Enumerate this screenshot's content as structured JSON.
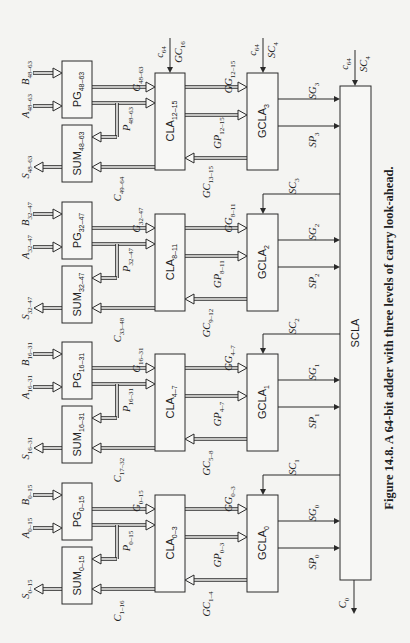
{
  "figure": {
    "caption": "Figure 14.8. A 64-bit adder with three levels of carry look-ahead.",
    "orientation": "rotated 90 degrees counter-clockwise"
  },
  "sections": [
    {
      "index": 3,
      "pg": {
        "name": "PG",
        "sub": "48–63"
      },
      "sum": {
        "name": "SUM",
        "sub": "48–63"
      },
      "cla": {
        "name": "CLA",
        "sub": "12–15"
      },
      "gcla": {
        "name": "GCLA",
        "sub": "3"
      },
      "inputs": [
        {
          "name": "A",
          "sub": "48–63"
        },
        {
          "name": "B",
          "sub": "48–63"
        }
      ],
      "output": {
        "name": "S",
        "sub": "48–63"
      },
      "g": {
        "name": "G",
        "sub": "48–63"
      },
      "p": {
        "name": "P",
        "sub": "48–63"
      },
      "c": {
        "name": "C",
        "sub": "49–64"
      },
      "gg": {
        "name": "GG",
        "sub": "12–15"
      },
      "gp": {
        "name": "GP",
        "sub": "12–15"
      },
      "gc": {
        "name": "GC",
        "sub": "13–15"
      },
      "sg": {
        "name": "SG",
        "sub": "3"
      },
      "sp": {
        "name": "SP",
        "sub": "3"
      },
      "carry_in_cla": {
        "line1": "c",
        "line1_sub": "64",
        "line2": "GC",
        "line2_sub": "16"
      },
      "carry_in_gcla": {
        "line1": "c",
        "line1_sub": "64",
        "line2": "SC",
        "line2_sub": "4"
      }
    },
    {
      "index": 2,
      "pg": {
        "name": "PG",
        "sub": "32–47"
      },
      "sum": {
        "name": "SUM",
        "sub": "32–47"
      },
      "cla": {
        "name": "CLA",
        "sub": "8–11"
      },
      "gcla": {
        "name": "GCLA",
        "sub": "2"
      },
      "inputs": [
        {
          "name": "A",
          "sub": "32–47"
        },
        {
          "name": "B",
          "sub": "32–47"
        }
      ],
      "output": {
        "name": "S",
        "sub": "32–47"
      },
      "g": {
        "name": "G",
        "sub": "32–47"
      },
      "p": {
        "name": "P",
        "sub": "32–47"
      },
      "c": {
        "name": "C",
        "sub": "33–48"
      },
      "gg": {
        "name": "GG",
        "sub": "8–11"
      },
      "gp": {
        "name": "GP",
        "sub": "8–11"
      },
      "gc": {
        "name": "GC",
        "sub": "9–12"
      },
      "sg": {
        "name": "SG",
        "sub": "2"
      },
      "sp": {
        "name": "SP",
        "sub": "2"
      },
      "sc": {
        "name": "SC",
        "sub": "3"
      }
    },
    {
      "index": 1,
      "pg": {
        "name": "PG",
        "sub": "16–31"
      },
      "sum": {
        "name": "SUM",
        "sub": "16–31"
      },
      "cla": {
        "name": "CLA",
        "sub": "4–7"
      },
      "gcla": {
        "name": "GCLA",
        "sub": "1"
      },
      "inputs": [
        {
          "name": "A",
          "sub": "16–31"
        },
        {
          "name": "B",
          "sub": "16–31"
        }
      ],
      "output": {
        "name": "S",
        "sub": "16–31"
      },
      "g": {
        "name": "G",
        "sub": "16–31"
      },
      "p": {
        "name": "P",
        "sub": "16–31"
      },
      "c": {
        "name": "C",
        "sub": "17–32"
      },
      "gg": {
        "name": "GG",
        "sub": "4–7"
      },
      "gp": {
        "name": "GP",
        "sub": "4–7"
      },
      "gc": {
        "name": "GC",
        "sub": "5–8"
      },
      "sg": {
        "name": "SG",
        "sub": "1"
      },
      "sp": {
        "name": "SP",
        "sub": "1"
      },
      "sc": {
        "name": "SC",
        "sub": "2"
      }
    },
    {
      "index": 0,
      "pg": {
        "name": "PG",
        "sub": "0–15"
      },
      "sum": {
        "name": "SUM",
        "sub": "0–15"
      },
      "cla": {
        "name": "CLA",
        "sub": "0–3"
      },
      "gcla": {
        "name": "GCLA",
        "sub": "0"
      },
      "inputs": [
        {
          "name": "A",
          "sub": "0–15"
        },
        {
          "name": "B",
          "sub": "0–15"
        }
      ],
      "output": {
        "name": "S",
        "sub": "0–15"
      },
      "g": {
        "name": "G",
        "sub": "0–15"
      },
      "p": {
        "name": "P",
        "sub": "0–15"
      },
      "c": {
        "name": "C",
        "sub": "1–16"
      },
      "gg": {
        "name": "GG",
        "sub": "0–3"
      },
      "gp": {
        "name": "GP",
        "sub": "0–3"
      },
      "gc": {
        "name": "GC",
        "sub": "1–4"
      },
      "sg": {
        "name": "SG",
        "sub": "0"
      },
      "sp": {
        "name": "SP",
        "sub": "0"
      },
      "sc": {
        "name": "SC",
        "sub": "1"
      }
    }
  ],
  "scla": {
    "name": "SCLA",
    "carry_in": {
      "line1": "c",
      "line1_sub": "64",
      "line2": "SC",
      "line2_sub": "4"
    },
    "carry_out": {
      "name": "C",
      "sub": "0"
    }
  },
  "colors": {
    "ink": "#2a2a2a",
    "paper": "#f4f4f2"
  }
}
